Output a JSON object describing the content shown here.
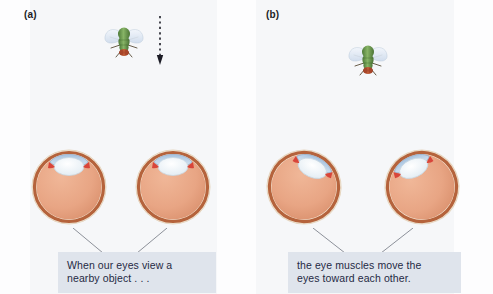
{
  "figure": {
    "background_color": "#fdfdfe"
  },
  "panels": [
    {
      "id": "a",
      "label": "(a)",
      "caption": "When our eyes view a\nnearby object . . .",
      "stimulus": {
        "name": "fly",
        "icon": "fly-icon",
        "position": "upper",
        "distance": "far"
      },
      "motion_arrow": {
        "name": "downward-dashed-arrow",
        "style": "dashed",
        "direction": "down",
        "visible": true
      },
      "eyes": [
        {
          "side": "left",
          "rotation_deg": 0,
          "state": "straight-ahead"
        },
        {
          "side": "right",
          "rotation_deg": 0,
          "state": "straight-ahead"
        }
      ]
    },
    {
      "id": "b",
      "label": "(b)",
      "caption": "the eye muscles move the\neyes toward each other.",
      "stimulus": {
        "name": "fly",
        "icon": "fly-icon",
        "position": "lower",
        "distance": "near"
      },
      "motion_arrow": {
        "name": "downward-dashed-arrow",
        "style": "dashed",
        "direction": "down",
        "visible": false
      },
      "eyes": [
        {
          "side": "left",
          "rotation_deg": 22,
          "state": "converged-inward"
        },
        {
          "side": "right",
          "rotation_deg": -22,
          "state": "converged-inward"
        }
      ]
    }
  ],
  "colors": {
    "globe_fill": "#e8a584",
    "globe_rim": "#b5633c",
    "sclera_outline": "#efe3d2",
    "cornea": "#bcd2e8",
    "lens": "#eef4f8",
    "iris_muscle": "#d8453a",
    "caption_background": "#dfe4ec",
    "caption_text": "#1f2a44",
    "leader_line": "#8c9099",
    "fly_body": "#6f9e52",
    "fly_head": "#b5502f",
    "fly_wing": "#dfe8f2",
    "arrow": "#1c1c26"
  },
  "anatomy_labels": {
    "globe": "eyeball globe",
    "cornea": "cornea",
    "lens": "lens",
    "iris": "iris muscle"
  }
}
